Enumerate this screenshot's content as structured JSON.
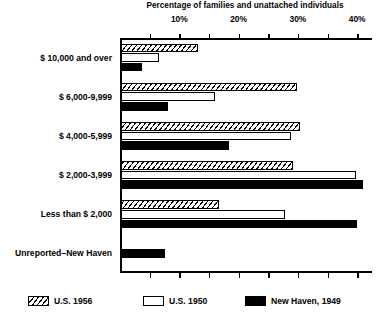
{
  "chart_data": {
    "type": "bar",
    "orientation": "horizontal",
    "title": "",
    "xlabel": "Percentage of families and unattached individuals",
    "ylabel": "",
    "xlim": [
      0,
      42.5
    ],
    "xticks": [
      0,
      5,
      10,
      15,
      20,
      25,
      30,
      35,
      40
    ],
    "xtick_labels": [
      "",
      "",
      "10%",
      "",
      "20%",
      "",
      "30%",
      "",
      "40%"
    ],
    "grid": false,
    "legend_position": "bottom",
    "categories": [
      "$ 10,000 and over",
      "$ 6,000-9,999",
      "$ 4,000-5,999",
      "$ 2,000-3,999",
      "Less than $ 2,000",
      "Unreported–New Haven"
    ],
    "series": [
      {
        "name": "U.S. 1956",
        "style": "hatched",
        "values": [
          13.0,
          29.6,
          30.2,
          29.0,
          16.6,
          null
        ]
      },
      {
        "name": "U.S. 1950",
        "style": "open",
        "values": [
          6.4,
          15.8,
          28.6,
          39.6,
          27.6,
          null
        ]
      },
      {
        "name": "New Haven, 1949",
        "style": "solid",
        "values": [
          3.6,
          8.0,
          18.2,
          40.8,
          39.8,
          7.4
        ]
      }
    ]
  },
  "axis": {
    "title": "Percentage of families and unattached individuals",
    "tick_labels": [
      "10%",
      "20%",
      "30%",
      "40%"
    ],
    "tick_values": [
      10,
      20,
      30,
      40
    ]
  },
  "legend": {
    "items": [
      {
        "label": "U.S. 1956",
        "swatch": "hatched-swatch"
      },
      {
        "label": "U.S. 1950",
        "swatch": "open-swatch"
      },
      {
        "label": "New Haven, 1949",
        "swatch": "solid-swatch"
      }
    ]
  },
  "colors": {
    "ink": "#000000",
    "paper": "#ffffff"
  }
}
